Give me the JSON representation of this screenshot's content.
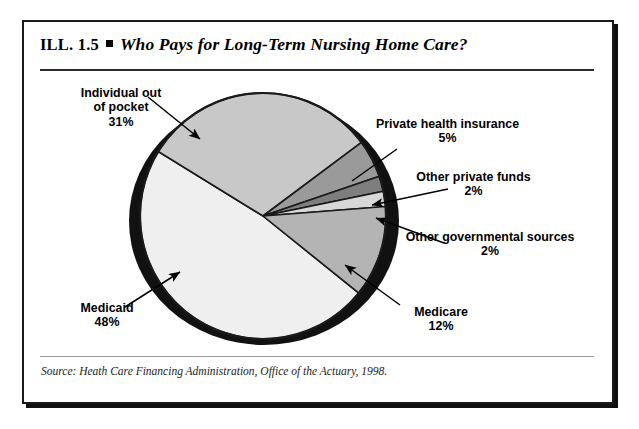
{
  "header": {
    "number": "ILL. 1.5",
    "bullet": "square-bullet",
    "title": "Who Pays for Long-Term Nursing Home Care?"
  },
  "source": "Source: Heath Care Financing Administration, Office of the Actuary, 1998.",
  "chart_data": {
    "type": "pie",
    "title": "Who Pays for Long-Term Nursing Home Care?",
    "units": "percent",
    "total": 100,
    "legend": "none",
    "labels_position": "outside-with-leader-lines",
    "categories": [
      "Individual out of pocket",
      "Private health insurance",
      "Other private funds",
      "Other governmental sources",
      "Medicare",
      "Medicaid"
    ],
    "values": [
      31,
      5,
      2,
      2,
      12,
      48
    ],
    "value_labels": [
      "31%",
      "5%",
      "2%",
      "2%",
      "12%",
      "48%"
    ],
    "colors": [
      "#c8c8c8",
      "#9a9a9a",
      "#808080",
      "#d8d8d8",
      "#b4b4b4",
      "#eeeeee"
    ],
    "slices": [
      {
        "name": "Individual out of pocket",
        "label": "Individual out\nof pocket",
        "label_line1": "Individual out",
        "label_line2": "of pocket",
        "value": 31,
        "value_label": "31%",
        "color": "#c8c8c8"
      },
      {
        "name": "Private health insurance",
        "label_line1": "Private health insurance",
        "label_line2": "",
        "value": 5,
        "value_label": "5%",
        "color": "#9a9a9a"
      },
      {
        "name": "Other private funds",
        "label_line1": "Other private funds",
        "label_line2": "",
        "value": 2,
        "value_label": "2%",
        "color": "#7e7e7e"
      },
      {
        "name": "Other governmental sources",
        "label_line1": "Other governmental sources",
        "label_line2": "",
        "value": 2,
        "value_label": "2%",
        "color": "#d8d8d8"
      },
      {
        "name": "Medicare",
        "label_line1": "Medicare",
        "label_line2": "",
        "value": 12,
        "value_label": "12%",
        "color": "#b4b4b4"
      },
      {
        "name": "Medicaid",
        "label_line1": "Medicaid",
        "label_line2": "",
        "value": 48,
        "value_label": "48%",
        "color": "#efefef"
      }
    ]
  }
}
